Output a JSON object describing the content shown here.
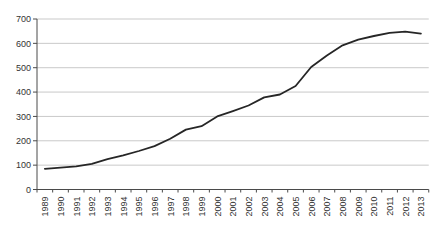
{
  "figure": {
    "width": 437,
    "height": 235,
    "background": "#ffffff"
  },
  "chart_data": {
    "type": "line",
    "title": "",
    "xlabel": "",
    "ylabel": "",
    "categories": [
      "1989",
      "1990",
      "1991",
      "1992",
      "1993",
      "1994",
      "1995",
      "1996",
      "1997",
      "1998",
      "1999",
      "2000",
      "2001",
      "2002",
      "2003",
      "2004",
      "2005",
      "2006",
      "2007",
      "2008",
      "2009",
      "2010",
      "2011",
      "2012",
      "2013"
    ],
    "values": [
      85,
      90,
      95,
      105,
      125,
      140,
      158,
      178,
      208,
      246,
      260,
      300,
      322,
      345,
      378,
      390,
      425,
      503,
      550,
      592,
      615,
      630,
      643,
      648,
      640
    ],
    "ylim": [
      0,
      700
    ],
    "ytick_step": 100,
    "yticks": [
      0,
      100,
      200,
      300,
      400,
      500,
      600,
      700
    ],
    "grid": true,
    "legend": false,
    "legend_position": "none",
    "marker": "none",
    "colors": {
      "line": "#262626",
      "grid": "#c9c9c9",
      "axis": "#4a4a4a",
      "tick_text": "#333333"
    },
    "x_label_rotation_deg": -90,
    "font_size_px": 9
  }
}
